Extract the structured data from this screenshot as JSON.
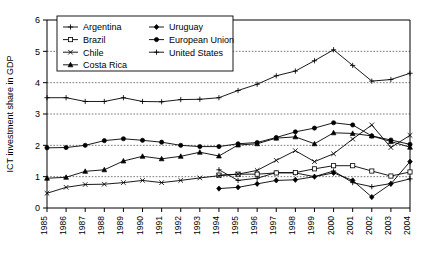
{
  "chart_data": {
    "type": "line",
    "title": "",
    "xlabel": "",
    "ylabel": "ICT investment share in GDP",
    "x": [
      1985,
      1986,
      1987,
      1988,
      1989,
      1990,
      1991,
      1992,
      1993,
      1994,
      1995,
      1996,
      1997,
      1998,
      1999,
      2000,
      2001,
      2002,
      2003,
      2004
    ],
    "xtick_labels": [
      "1985",
      "1986",
      "1987",
      "1988",
      "1989",
      "1990",
      "1991",
      "1992",
      "1993",
      "1994",
      "1995",
      "1996",
      "1997",
      "1998",
      "1999",
      "2000",
      "2001",
      "2002",
      "2003",
      "2004"
    ],
    "ytick_labels": [
      "0",
      "1",
      "2",
      "3",
      "4",
      "5",
      "6"
    ],
    "yticks": [
      0,
      1,
      2,
      3,
      4,
      5,
      6
    ],
    "ylim": [
      0,
      6
    ],
    "grid": "horizontal-dotted",
    "legend_position": "top-left-inside",
    "series": [
      {
        "name": "Argentina",
        "marker": "plus",
        "x": [
          1994,
          1995,
          1996,
          1997,
          1998,
          1999,
          2000,
          2001,
          2002,
          2003,
          2004
        ],
        "values": [
          1.22,
          0.88,
          0.95,
          1.13,
          1.12,
          1.0,
          1.18,
          0.81,
          0.68,
          0.78,
          0.93
        ]
      },
      {
        "name": "Brazil",
        "marker": "open-square",
        "x": [
          1994,
          1995,
          1996,
          1997,
          1998,
          1999,
          2000,
          2001,
          2002,
          2003,
          2004
        ],
        "values": [
          1.05,
          1.08,
          1.08,
          1.12,
          1.13,
          1.25,
          1.35,
          1.35,
          1.18,
          1.02,
          1.15
        ]
      },
      {
        "name": "Chile",
        "marker": "x-cross",
        "x": [
          1985,
          1986,
          1987,
          1988,
          1989,
          1990,
          1991,
          1992,
          1993,
          1994,
          1995,
          1996,
          1997,
          1998,
          1999,
          2000,
          2001,
          2002,
          2003,
          2004
        ],
        "values": [
          0.47,
          0.66,
          0.75,
          0.76,
          0.81,
          0.88,
          0.81,
          0.88,
          0.96,
          1.03,
          1.08,
          1.2,
          1.52,
          1.83,
          1.48,
          1.73,
          2.2,
          2.65,
          1.93,
          2.32
        ]
      },
      {
        "name": "Costa Rica",
        "marker": "filled-triangle",
        "x": [
          1985,
          1986,
          1987,
          1988,
          1989,
          1990,
          1991,
          1992,
          1993,
          1994,
          1995,
          1996,
          1997,
          1998,
          1999,
          2000,
          2001,
          2002,
          2003,
          2004
        ],
        "values": [
          0.95,
          0.98,
          1.17,
          1.22,
          1.5,
          1.65,
          1.57,
          1.65,
          1.78,
          1.66,
          2.01,
          2.05,
          2.23,
          2.27,
          2.05,
          2.4,
          2.38,
          2.3,
          2.12,
          1.94
        ]
      },
      {
        "name": "Uruguay",
        "marker": "filled-diamond",
        "x": [
          1994,
          1995,
          1996,
          1997,
          1998,
          1999,
          2000,
          2001,
          2002,
          2003,
          2004
        ],
        "values": [
          0.62,
          0.66,
          0.77,
          0.88,
          0.9,
          1.0,
          1.12,
          0.88,
          0.35,
          0.77,
          1.48
        ]
      },
      {
        "name": "European Union",
        "marker": "filled-circle",
        "x": [
          1985,
          1986,
          1987,
          1988,
          1989,
          1990,
          1991,
          1992,
          1993,
          1994,
          1995,
          1996,
          1997,
          1998,
          1999,
          2000,
          2001,
          2002,
          2003,
          2004
        ],
        "values": [
          1.92,
          1.93,
          2.0,
          2.15,
          2.21,
          2.16,
          2.1,
          2.0,
          1.96,
          1.96,
          2.05,
          2.09,
          2.25,
          2.43,
          2.55,
          2.72,
          2.65,
          2.3,
          2.17,
          2.03
        ]
      },
      {
        "name": "United States",
        "marker": "plus",
        "x": [
          1985,
          1986,
          1987,
          1988,
          1989,
          1990,
          1991,
          1992,
          1993,
          1994,
          1995,
          1996,
          1997,
          1998,
          1999,
          2000,
          2001,
          2002,
          2003,
          2004
        ],
        "values": [
          3.52,
          3.52,
          3.4,
          3.4,
          3.52,
          3.4,
          3.39,
          3.46,
          3.47,
          3.52,
          3.75,
          3.95,
          4.22,
          4.37,
          4.7,
          5.05,
          4.55,
          4.05,
          4.1,
          4.3
        ]
      }
    ],
    "legend_columns": [
      [
        "Argentina",
        "Brazil",
        "Chile",
        "Costa Rica"
      ],
      [
        "Uruguay",
        "European Union",
        "United States"
      ]
    ]
  }
}
